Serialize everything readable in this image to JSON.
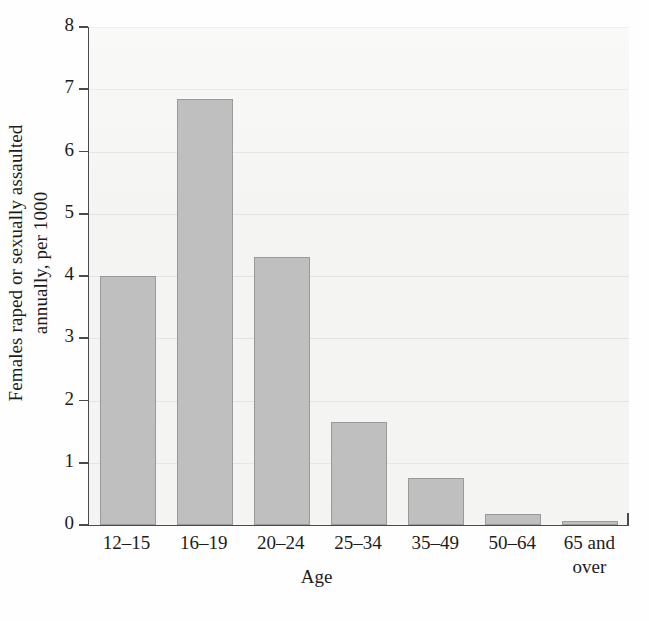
{
  "chart_data": {
    "type": "bar",
    "title": "",
    "categories": [
      "12–15",
      "16–19",
      "20–24",
      "25–34",
      "35–49",
      "50–64",
      "65 and over"
    ],
    "values": [
      4.0,
      6.85,
      4.3,
      1.65,
      0.75,
      0.17,
      0.07
    ],
    "xlabel": "Age",
    "ylabel_line1": "Females raped or sexually assaulted",
    "ylabel_line2": "annually, per 1000",
    "ylabel": "Females raped or sexually assaulted annually, per 1000",
    "ylim": [
      0,
      8
    ],
    "ytick_labels": [
      "0",
      "1",
      "2",
      "3",
      "4",
      "5",
      "6",
      "7",
      "8"
    ],
    "ytick_values": [
      0,
      1,
      2,
      3,
      4,
      5,
      6,
      7,
      8
    ],
    "grid": true,
    "legend": "none",
    "bar_color": "#bfbfbf",
    "bar_edge_color": "#9a9a9a",
    "axis_color": "#4a4a4a",
    "panel_color": "#f2f2f0",
    "gridline_color": "#dcdcda"
  },
  "xtick_lines": [
    {
      "l1": "12–15",
      "l2": ""
    },
    {
      "l1": "16–19",
      "l2": ""
    },
    {
      "l1": "20–24",
      "l2": ""
    },
    {
      "l1": "25–34",
      "l2": ""
    },
    {
      "l1": "35–49",
      "l2": ""
    },
    {
      "l1": "50–64",
      "l2": ""
    },
    {
      "l1": "65 and",
      "l2": "over"
    }
  ]
}
